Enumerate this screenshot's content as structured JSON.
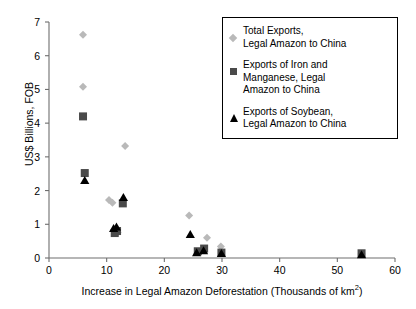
{
  "chart_data": {
    "type": "scatter",
    "title": "",
    "xlabel": "Increase in Legal Amazon Deforestation (Thousands of km",
    "xlabel_sup": "2",
    "xlabel_tail": ")",
    "ylabel": "US$ Billions, FOB",
    "xlim": [
      0,
      60
    ],
    "ylim": [
      0,
      7
    ],
    "xticks": [
      0,
      10,
      20,
      30,
      40,
      50,
      60
    ],
    "yticks": [
      0,
      1,
      2,
      3,
      4,
      5,
      6,
      7
    ],
    "grid": false,
    "legend_position": "top-right",
    "colors": {
      "total_exports": "#b9b9b9",
      "iron_manganese": "#4a4a4a",
      "soybean": "#000000",
      "axis": "#6e6e6e"
    },
    "series": [
      {
        "name": "Total Exports,\nLegal Amazon to China",
        "marker": "diamond",
        "color": "#b9b9b9",
        "points": [
          [
            5.9,
            6.62
          ],
          [
            5.9,
            5.08
          ],
          [
            13.2,
            3.32
          ],
          [
            10.4,
            1.72
          ],
          [
            11.0,
            1.64
          ],
          [
            11.3,
            0.82
          ],
          [
            11.9,
            0.76
          ],
          [
            24.3,
            1.26
          ],
          [
            27.4,
            0.6
          ],
          [
            29.8,
            0.34
          ],
          [
            54.2,
            0.12
          ]
        ]
      },
      {
        "name": "Exports of Iron and\nManganese, Legal\nAmazon to China",
        "marker": "square",
        "color": "#4a4a4a",
        "points": [
          [
            5.9,
            4.2
          ],
          [
            6.2,
            2.52
          ],
          [
            12.8,
            1.62
          ],
          [
            11.8,
            0.8
          ],
          [
            11.4,
            0.74
          ],
          [
            25.8,
            0.2
          ],
          [
            26.9,
            0.28
          ],
          [
            29.9,
            0.16
          ],
          [
            54.2,
            0.14
          ]
        ]
      },
      {
        "name": "Exports of Soybean,\nLegal Amazon to China",
        "marker": "triangle",
        "color": "#000000",
        "points": [
          [
            6.2,
            2.3
          ],
          [
            12.9,
            1.8
          ],
          [
            11.7,
            0.92
          ],
          [
            11.2,
            0.88
          ],
          [
            24.5,
            0.7
          ],
          [
            25.6,
            0.16
          ],
          [
            26.8,
            0.22
          ],
          [
            29.9,
            0.14
          ],
          [
            54.2,
            0.1
          ]
        ]
      }
    ]
  },
  "legend": {
    "items": [
      {
        "marker": "diamond-marker",
        "label": "Total Exports,\nLegal Amazon to China"
      },
      {
        "marker": "square-marker",
        "label": "Exports of Iron and\nManganese, Legal\nAmazon to China"
      },
      {
        "marker": "triangle-marker",
        "label": "Exports of Soybean,\nLegal Amazon to China"
      }
    ]
  },
  "axes": {
    "x_label_main": "Increase in Legal Amazon Deforestation (Thousands of km",
    "x_label_sup": "2",
    "x_label_close": ")",
    "y_label": "US$ Billions, FOB"
  }
}
